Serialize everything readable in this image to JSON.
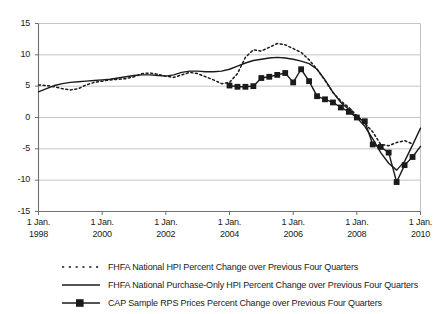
{
  "chart_data": {
    "type": "line",
    "title": "",
    "xlabel": "",
    "ylabel": "",
    "xlim": [
      1998.0,
      2010.0
    ],
    "ylim": [
      -15,
      15
    ],
    "grid": true,
    "legend_position": "bottom",
    "y_ticks": [
      15,
      10,
      5,
      0,
      -5,
      -10,
      -15
    ],
    "y_tick_labels": [
      "15",
      "10",
      "5",
      "0",
      "-5",
      "-10",
      "-15"
    ],
    "x_ticks": [
      1998,
      2000,
      2002,
      2004,
      2006,
      2008,
      2010
    ],
    "x_tick_labels": [
      {
        "day": "1 Jan.",
        "year": "1998"
      },
      {
        "day": "1 Jan.",
        "year": "2000"
      },
      {
        "day": "1 Jan.",
        "year": "2002"
      },
      {
        "day": "1 Jan.",
        "year": "2004"
      },
      {
        "day": "1 Jan.",
        "year": "2006"
      },
      {
        "day": "1 Jan.",
        "year": "2008"
      },
      {
        "day": "1 Jan.",
        "year": "2010"
      }
    ],
    "series": [
      {
        "name": "FHFA National HPI Percent Change over Previous Four Quarters",
        "style": "dotted",
        "color": "#1a1a1a",
        "marker": "none",
        "x": [
          1998.0,
          1998.25,
          1998.5,
          1998.75,
          1999.0,
          1999.25,
          1999.5,
          1999.75,
          2000.0,
          2000.25,
          2000.5,
          2000.75,
          2001.0,
          2001.25,
          2001.5,
          2001.75,
          2002.0,
          2002.25,
          2002.5,
          2002.75,
          2003.0,
          2003.25,
          2003.5,
          2003.75,
          2004.0,
          2004.25,
          2004.5,
          2004.75,
          2005.0,
          2005.25,
          2005.5,
          2005.75,
          2006.0,
          2006.25,
          2006.5,
          2006.75,
          2007.0,
          2007.25,
          2007.5,
          2007.75,
          2008.0,
          2008.25,
          2008.5,
          2008.75,
          2009.0,
          2009.25,
          2009.5,
          2009.75
        ],
        "y": [
          5.2,
          5.1,
          4.9,
          4.6,
          4.4,
          4.6,
          5.2,
          5.6,
          5.8,
          6.0,
          6.1,
          6.2,
          6.5,
          7.0,
          7.1,
          6.9,
          6.6,
          6.4,
          6.8,
          7.2,
          7.0,
          6.5,
          6.0,
          5.4,
          5.6,
          7.0,
          9.6,
          10.8,
          10.6,
          11.2,
          11.8,
          11.6,
          11.0,
          10.4,
          9.2,
          7.7,
          5.9,
          4.0,
          2.6,
          1.6,
          0.3,
          -0.9,
          -2.3,
          -4.3,
          -4.5,
          -4.0,
          -3.7,
          -4.2
        ],
        "note": "Dotted series begins at 1998 and ends near 2010"
      },
      {
        "name": "FHFA National Purchase-Only HPI Percent Change over Previous Four Quarters",
        "style": "solid",
        "color": "#1a1a1a",
        "marker": "none",
        "x": [
          1998.0,
          1998.25,
          1998.5,
          1998.75,
          1999.0,
          1999.25,
          1999.5,
          1999.75,
          2000.0,
          2000.25,
          2000.5,
          2000.75,
          2001.0,
          2001.25,
          2001.5,
          2001.75,
          2002.0,
          2002.25,
          2002.5,
          2002.75,
          2003.0,
          2003.25,
          2003.5,
          2003.75,
          2004.0,
          2004.25,
          2004.5,
          2004.75,
          2005.0,
          2005.25,
          2005.5,
          2005.75,
          2006.0,
          2006.25,
          2006.5,
          2006.75,
          2007.0,
          2007.25,
          2007.5,
          2007.75,
          2008.0,
          2008.25,
          2008.5,
          2008.75,
          2009.0,
          2009.25,
          2009.5,
          2009.75,
          2010.0
        ],
        "y": [
          4.1,
          4.6,
          5.1,
          5.4,
          5.6,
          5.7,
          5.8,
          5.9,
          6.0,
          6.1,
          6.3,
          6.5,
          6.7,
          6.8,
          6.8,
          6.7,
          6.6,
          6.8,
          7.2,
          7.4,
          7.4,
          7.3,
          7.3,
          7.4,
          7.7,
          8.2,
          8.7,
          9.1,
          9.3,
          9.5,
          9.6,
          9.5,
          9.3,
          9.0,
          8.6,
          7.7,
          6.0,
          4.0,
          2.4,
          1.3,
          0.0,
          -1.4,
          -3.4,
          -5.6,
          -7.3,
          -8.4,
          -7.0,
          -4.4,
          -1.7
        ],
        "note": "Solid series spans full range and ends at -1.7 in 2010"
      },
      {
        "name": "CAP Sample RPS Prices Percent Change over Previous Four Quarters",
        "style": "solid-marker",
        "color": "#1a1a1a",
        "marker": "square",
        "x": [
          2004.0,
          2004.25,
          2004.5,
          2004.75,
          2005.0,
          2005.25,
          2005.5,
          2005.75,
          2006.0,
          2006.25,
          2006.5,
          2006.75,
          2007.0,
          2007.25,
          2007.5,
          2007.75,
          2008.0,
          2008.25,
          2008.5,
          2008.75,
          2009.0,
          2009.25,
          2009.5,
          2009.75
        ],
        "y": [
          5.1,
          4.9,
          4.9,
          5.0,
          6.3,
          6.5,
          6.8,
          7.1,
          5.6,
          7.7,
          5.8,
          3.4,
          2.9,
          2.4,
          1.6,
          0.9,
          0.0,
          -0.6,
          -4.3,
          -4.7,
          -5.6,
          -10.3,
          -7.6,
          -6.3
        ],
        "y_end": -4.6,
        "note": "Marker series begins 2004 and ends near -4.6 at 2010"
      }
    ]
  },
  "axes": {
    "y_label_units": "percent",
    "x_label_units": "date"
  },
  "legend": {
    "entries": [
      {
        "swatch": "dotted-line-swatch",
        "label": "FHFA National HPI Percent Change over Previous Four Quarters"
      },
      {
        "swatch": "solid-line-swatch",
        "label": "FHFA National Purchase-Only HPI Percent Change over Previous Four Quarters"
      },
      {
        "swatch": "marker-line-swatch",
        "label": "CAP Sample RPS Prices Percent Change over Previous Four Quarters"
      }
    ]
  },
  "colors": {
    "line": "#1a1a1a",
    "grid": "#bdbdbd",
    "axis": "#808080",
    "background": "#ffffff"
  }
}
